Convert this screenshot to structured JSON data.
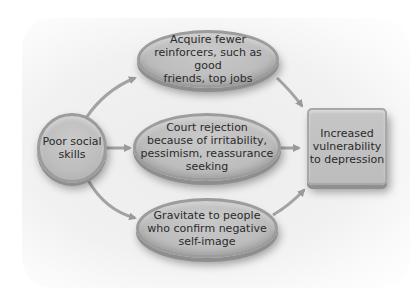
{
  "diagram": {
    "type": "flow",
    "nodes": {
      "source": {
        "label": "Poor social\nskills",
        "shape": "circle"
      },
      "path1": {
        "label": "Acquire fewer\nreinforcers, such as good\nfriends, top jobs",
        "shape": "ellipse"
      },
      "path2": {
        "label": "Court rejection\nbecause of irritability,\npessimism, reassurance\nseeking",
        "shape": "ellipse"
      },
      "path3": {
        "label": "Gravitate to people\nwho confirm negative\nself-image",
        "shape": "ellipse"
      },
      "outcome": {
        "label": "Increased\nvulnerability\nto depression",
        "shape": "rounded-box"
      }
    },
    "edges": [
      {
        "from": "source",
        "to": "path1"
      },
      {
        "from": "source",
        "to": "path2"
      },
      {
        "from": "source",
        "to": "path3"
      },
      {
        "from": "path1",
        "to": "outcome"
      },
      {
        "from": "path2",
        "to": "outcome"
      },
      {
        "from": "path3",
        "to": "outcome"
      }
    ],
    "colors": {
      "node_fill": "#bdbdbd",
      "node_border": "#9c9c9c",
      "arrow": "#9a9a9a",
      "text": "#2a2a2a",
      "background": "#efefef"
    }
  }
}
